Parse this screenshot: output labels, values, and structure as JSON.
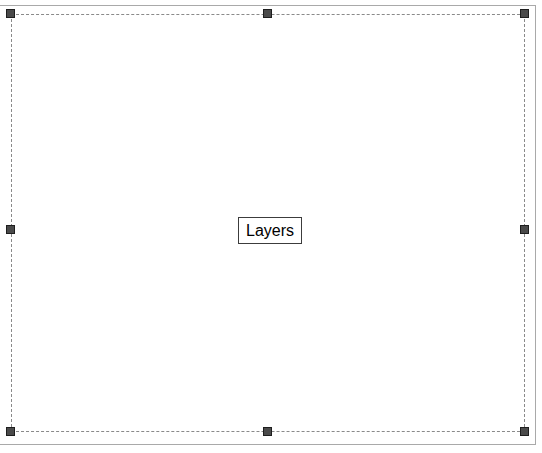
{
  "window": {
    "title": "Layers",
    "width": 542,
    "height": 453,
    "background_color": "#ffffff"
  },
  "canvas": {
    "name": "design-canvas",
    "grid": {
      "visible": true,
      "dot_spacing_px": 17.6,
      "dot_color": "#f2f2f2"
    },
    "frame": {
      "border_color": "#a9a9a9",
      "border_width_px": 1
    }
  },
  "selection": {
    "name": "selected-object",
    "label": "Layers",
    "style": "dashed",
    "border_color": "#8a8a8a",
    "bounds": {
      "left": 11,
      "top": 14,
      "width": 514,
      "height": 418
    },
    "handles": [
      {
        "position": "top-left",
        "name": "resize-handle-nw",
        "x": 11,
        "y": 14
      },
      {
        "position": "top-center",
        "name": "resize-handle-n",
        "x": 268,
        "y": 14
      },
      {
        "position": "top-right",
        "name": "resize-handle-ne",
        "x": 525,
        "y": 14
      },
      {
        "position": "middle-left",
        "name": "resize-handle-w",
        "x": 11,
        "y": 230
      },
      {
        "position": "middle-right",
        "name": "resize-handle-e",
        "x": 525,
        "y": 230
      },
      {
        "position": "bottom-left",
        "name": "resize-handle-sw",
        "x": 11,
        "y": 432
      },
      {
        "position": "bottom-center",
        "name": "resize-handle-s",
        "x": 268,
        "y": 432
      },
      {
        "position": "bottom-right",
        "name": "resize-handle-se",
        "x": 525,
        "y": 432
      }
    ],
    "handle_color": "#4a4a4a",
    "handle_border_color": "#1e1e1e"
  },
  "center_label": {
    "name": "layers-label",
    "text": "Layers",
    "text_color": "#000000",
    "border_color": "#3c3c3c",
    "background_color": "#ffffff",
    "font_size_px": 16
  }
}
